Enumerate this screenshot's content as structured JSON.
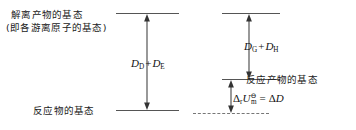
{
  "figure": {
    "type": "energy-level-diagram",
    "background": "#ffffff",
    "line_color": "#555555",
    "text_color": "#1a1a1a"
  },
  "left_panel": {
    "top_level_label_line1": "解离产物的基态",
    "top_level_label_line2": "(即各游离原子的基态)",
    "bottom_level_label": "反应物的基态",
    "arrow_formula": {
      "symbol1": "D",
      "sub1": "D",
      "operator": "+",
      "symbol2": "D",
      "sub2": "E"
    }
  },
  "right_panel": {
    "middle_level_label": "反应产物的基态",
    "upper_arrow_formula": {
      "symbol1": "D",
      "sub1": "G",
      "operator": "+",
      "symbol2": "D",
      "sub2": "H"
    },
    "lower_arrow_formula": {
      "delta_r": "Δ",
      "sub_r": "r",
      "u_symbol": "U",
      "sub_m": "m",
      "sup_standard": "⊖",
      "equals": "=",
      "delta_d": "Δ",
      "d_symbol": "D"
    }
  }
}
